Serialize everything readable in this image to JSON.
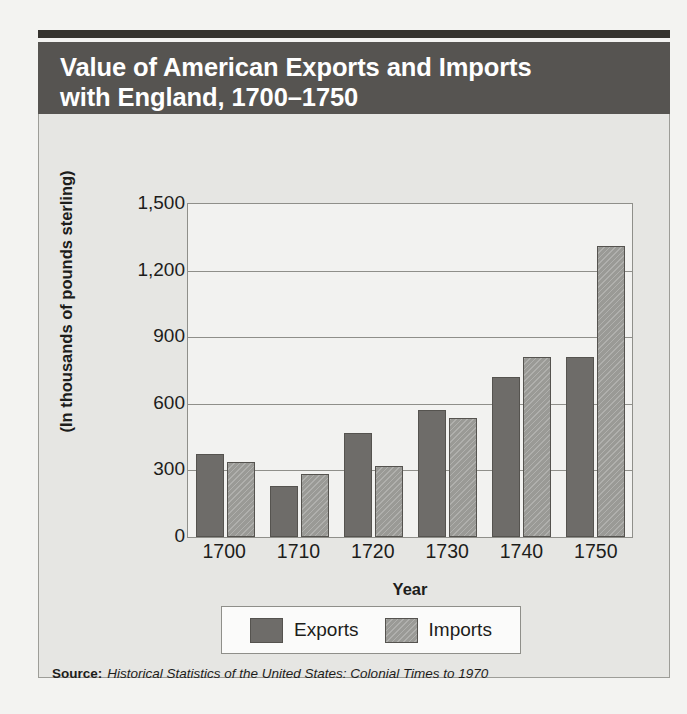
{
  "figure": {
    "title": "Value of American Exports and Imports\nwith England, 1700–1750",
    "source_label": "Source:",
    "source_title": "Historical Statistics of the United States: Colonial Times to 1970"
  },
  "colors": {
    "title_band": "#565451",
    "top_rule": "#35332f",
    "panel_bg": "#e6e6e3",
    "exports": "#6e6c69",
    "imports": "#9a9a96",
    "plot_bg": "#f2f2f0",
    "axis": "#8f8f8a",
    "text": "#1d1d1b"
  },
  "chart_data": {
    "type": "bar",
    "title": "Value of American Exports and Imports with England, 1700–1750",
    "xlabel": "Year",
    "ylabel": "(In thousands of pounds sterling)",
    "categories": [
      "1700",
      "1710",
      "1720",
      "1730",
      "1740",
      "1750"
    ],
    "ytick_labels": [
      "1,500",
      "1,200",
      "900",
      "600",
      "300",
      "0"
    ],
    "yticks": [
      1500,
      1200,
      900,
      600,
      300,
      0
    ],
    "ylim": [
      0,
      1500
    ],
    "grid": true,
    "legend_position": "bottom",
    "series": [
      {
        "name": "Exports",
        "color": "#6e6c69",
        "values": [
          375,
          230,
          470,
          570,
          720,
          810
        ]
      },
      {
        "name": "Imports",
        "color": "#9a9a96",
        "values": [
          340,
          285,
          320,
          535,
          810,
          1310
        ]
      }
    ]
  }
}
